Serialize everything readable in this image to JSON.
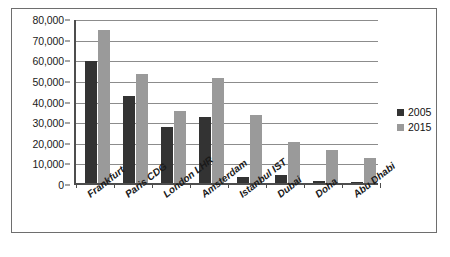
{
  "chart_data": {
    "type": "bar",
    "title": "",
    "xlabel": "",
    "ylabel": "",
    "ylim": [
      0,
      80000
    ],
    "ytick_step": 10000,
    "grid": true,
    "legend_position": "right",
    "categories": [
      "Frankfurt",
      "Paris CDG",
      "London LHR",
      "Amsterdam",
      "Istanbul IST",
      "Dubai",
      "Doha",
      "Abu Dhabi"
    ],
    "ytick_labels": [
      "80,000",
      "70,000",
      "60,000",
      "50,000",
      "40,000",
      "30,000",
      "20,000",
      "10,000",
      "0"
    ],
    "ytick_values": [
      80000,
      70000,
      60000,
      50000,
      40000,
      30000,
      20000,
      10000,
      0
    ],
    "series": [
      {
        "name": "2005",
        "color": "#333333",
        "values": [
          59000,
          42000,
          27000,
          32000,
          3000,
          4000,
          1000,
          700
        ]
      },
      {
        "name": "2015",
        "color": "#9a9a9a",
        "values": [
          74000,
          53000,
          35000,
          51000,
          33000,
          20000,
          16000,
          12000
        ]
      }
    ]
  },
  "legend": {
    "items": [
      {
        "label": "2005",
        "color": "#333333"
      },
      {
        "label": "2015",
        "color": "#9a9a9a"
      }
    ]
  }
}
